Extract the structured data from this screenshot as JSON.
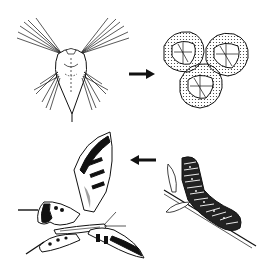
{
  "diagram": {
    "type": "life-cycle illustration",
    "colors": {
      "ink": "#111111",
      "background": "#ffffff",
      "shade": "#555555"
    },
    "stages": [
      {
        "id": "larva",
        "name": "Nauplius larva",
        "position": "top-left"
      },
      {
        "id": "eggs",
        "name": "Eggs / cysts (three)",
        "position": "top-right"
      },
      {
        "id": "caterpillar",
        "name": "Caterpillar on twig",
        "position": "bottom-right"
      },
      {
        "id": "butterfly",
        "name": "Swallowtail butterfly",
        "position": "bottom-left"
      }
    ],
    "arrows": [
      {
        "from": "larva",
        "to": "eggs",
        "direction": "right"
      },
      {
        "from": "caterpillar",
        "to": "butterfly",
        "direction": "left"
      }
    ]
  }
}
